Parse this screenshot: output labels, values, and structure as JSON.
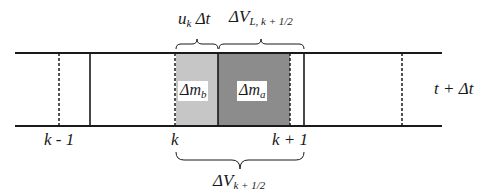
{
  "diagram": {
    "type": "staggered grid cell / control volume",
    "time_label": "t + Δt",
    "node_labels": [
      {
        "id": "k-1",
        "text": "k - 1"
      },
      {
        "id": "k",
        "text": "k"
      },
      {
        "id": "k+1",
        "text": "k + 1"
      }
    ],
    "regions": [
      {
        "id": "mass_b",
        "label_main": "Δm",
        "label_sub": "b",
        "shade": "#c8c8c8"
      },
      {
        "id": "mass_a",
        "label_main": "Δm",
        "label_sub": "a",
        "shade": "#8f8f8f"
      }
    ],
    "braces": {
      "top_left": {
        "main": "u",
        "sub": "k",
        "tail": " Δt"
      },
      "top_right": {
        "main": "ΔV",
        "sub": "L, k + 1/2"
      },
      "bottom": {
        "main": "ΔV",
        "sub": "k + 1/2"
      }
    },
    "colors": {
      "line": "#1a1a1a",
      "light_shade": "#c8c8c8",
      "dark_shade": "#8f8f8f",
      "background": "#ffffff"
    }
  }
}
